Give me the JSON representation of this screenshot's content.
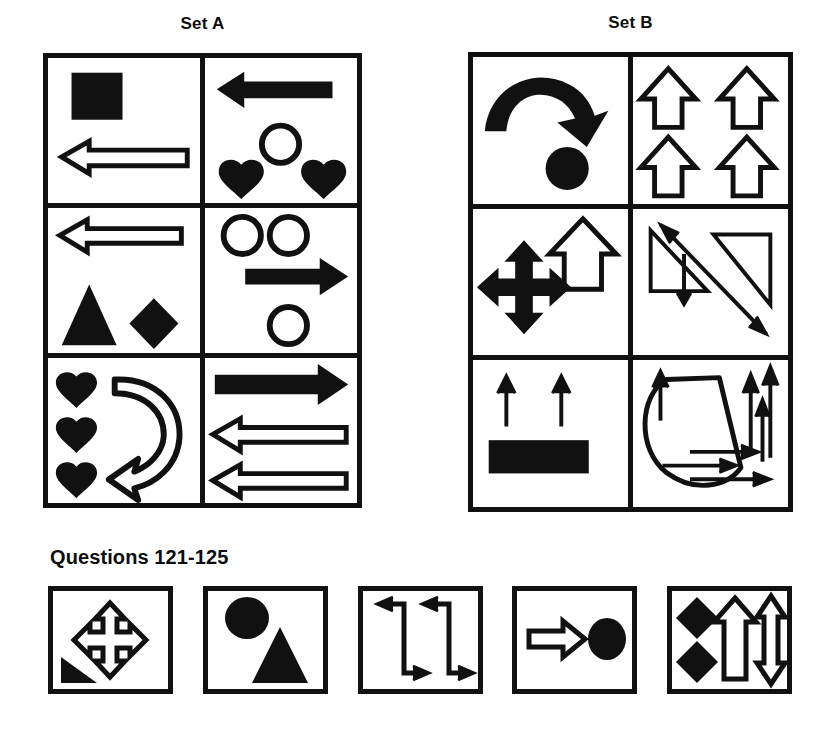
{
  "sets": [
    {
      "id": "set-a",
      "title": "Set A",
      "cells": [
        {
          "name": "cell-a1",
          "shapes": [
            "filled-square",
            "outline-left-arrow"
          ]
        },
        {
          "name": "cell-a2",
          "shapes": [
            "filled-left-arrow",
            "outline-circle",
            "filled-heart",
            "filled-heart"
          ]
        },
        {
          "name": "cell-a3",
          "shapes": [
            "outline-left-arrow",
            "filled-triangle",
            "filled-diamond"
          ]
        },
        {
          "name": "cell-a4",
          "shapes": [
            "outline-circle",
            "outline-circle",
            "filled-right-arrow",
            "outline-circle"
          ]
        },
        {
          "name": "cell-a5",
          "shapes": [
            "filled-heart",
            "filled-heart",
            "filled-heart",
            "outline-curved-arrow"
          ]
        },
        {
          "name": "cell-a6",
          "shapes": [
            "filled-right-arrow",
            "outline-left-arrow",
            "outline-left-arrow"
          ]
        }
      ]
    },
    {
      "id": "set-b",
      "title": "Set B",
      "cells": [
        {
          "name": "cell-b1",
          "shapes": [
            "filled-curved-arrow",
            "filled-circle"
          ]
        },
        {
          "name": "cell-b2",
          "shapes": [
            "outline-up-arrow",
            "outline-up-arrow",
            "outline-up-arrow",
            "outline-up-arrow"
          ]
        },
        {
          "name": "cell-b3",
          "shapes": [
            "filled-four-way-arrow",
            "outline-up-arrow"
          ]
        },
        {
          "name": "cell-b4",
          "shapes": [
            "outline-triangle",
            "outline-triangle",
            "double-headed-diagonal-arrow",
            "thin-down-arrow"
          ]
        },
        {
          "name": "cell-b5",
          "shapes": [
            "thin-up-arrow",
            "thin-up-arrow",
            "filled-rectangle"
          ]
        },
        {
          "name": "cell-b6",
          "shapes": [
            "loop-shape",
            "thin-up-arrow",
            "thin-up-arrow",
            "thin-up-arrow",
            "thin-right-arrow",
            "thin-right-arrow",
            "thin-right-arrow"
          ]
        }
      ]
    }
  ],
  "questions": {
    "title": "Questions 121-125",
    "boxes": [
      {
        "name": "question-box-121",
        "shapes": [
          "outline-four-way-arrow",
          "filled-right-triangle"
        ]
      },
      {
        "name": "question-box-122",
        "shapes": [
          "filled-ellipse",
          "filled-triangle"
        ]
      },
      {
        "name": "question-box-123",
        "shapes": [
          "zigzag-arrow",
          "zigzag-arrow"
        ]
      },
      {
        "name": "question-box-124",
        "shapes": [
          "outline-right-arrow",
          "filled-circle"
        ]
      },
      {
        "name": "question-box-125",
        "shapes": [
          "filled-diamond",
          "filled-diamond",
          "outline-up-arrow",
          "outline-double-headed-vertical-arrow"
        ]
      }
    ]
  },
  "colors": {
    "ink": "#111111",
    "paper": "#ffffff"
  }
}
